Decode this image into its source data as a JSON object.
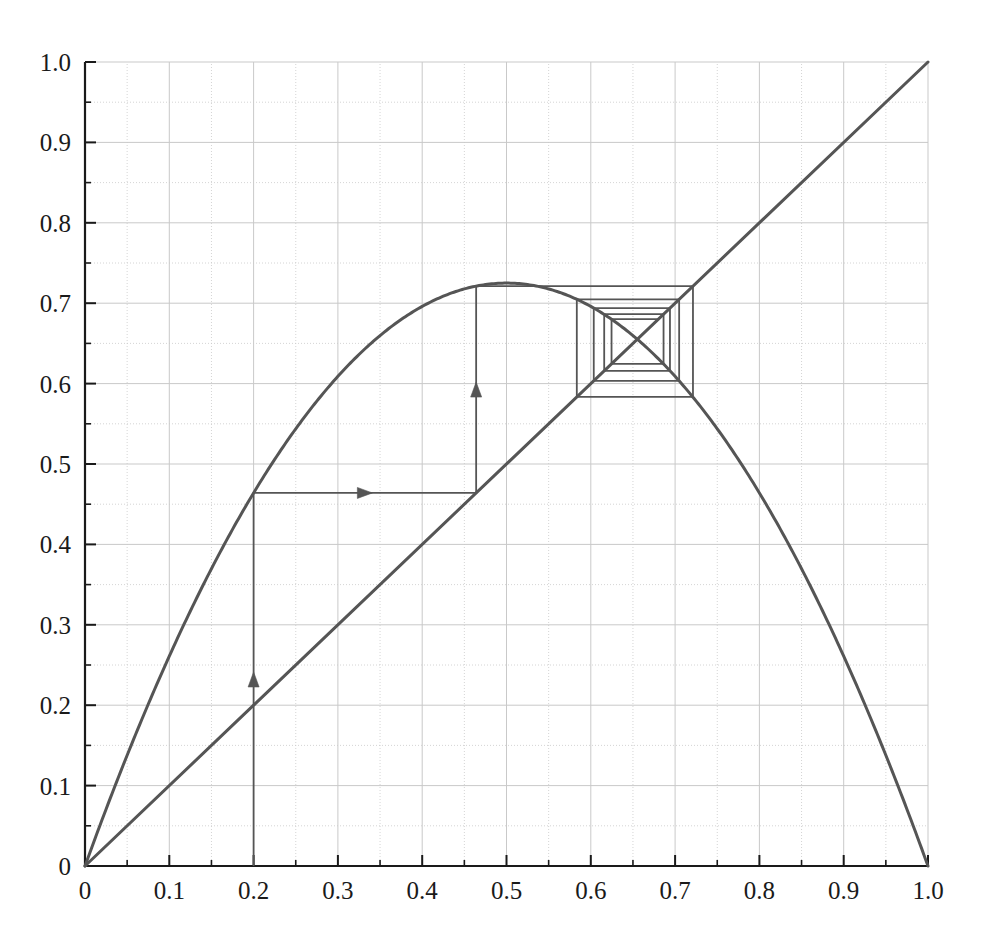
{
  "figure": {
    "background": "#ffffff",
    "width": 981,
    "height": 941
  },
  "chart_data": {
    "type": "line",
    "title": "",
    "subtitle": "",
    "xlabel": "",
    "ylabel": "",
    "xlim": [
      0,
      1
    ],
    "ylim": [
      0,
      1
    ],
    "grid": true,
    "grid_step": 0.05,
    "grid_color": "#c9c9c9",
    "axis_color": "#1a1a1a",
    "curve_color": "#555555",
    "legend": null,
    "legend_position": "none",
    "x_ticks": [
      "0",
      "0.1",
      "0.2",
      "0.3",
      "0.4",
      "0.5",
      "0.6",
      "0.7",
      "0.8",
      "0.9",
      "1.0"
    ],
    "x_tick_values": [
      0,
      0.1,
      0.2,
      0.3,
      0.4,
      0.5,
      0.6,
      0.7,
      0.8,
      0.9,
      1.0
    ],
    "y_ticks": [
      "0",
      "0.1",
      "0.2",
      "0.3",
      "0.4",
      "0.5",
      "0.6",
      "0.7",
      "0.8",
      "0.9",
      "1.0"
    ],
    "y_tick_values": [
      0,
      0.1,
      0.2,
      0.3,
      0.4,
      0.5,
      0.6,
      0.7,
      0.8,
      0.9,
      1.0
    ],
    "minor_tick_values": [
      0.05,
      0.15,
      0.25,
      0.35,
      0.45,
      0.55,
      0.65,
      0.75,
      0.85,
      0.95
    ],
    "series": [
      {
        "name": "logistic-map",
        "kind": "parabola",
        "formula": "f(x) = r x (1 - x)",
        "r": 2.9,
        "peak": [
          0.5,
          0.725
        ],
        "endpoints": [
          [
            0,
            0
          ],
          [
            1,
            0
          ]
        ],
        "color": "#555555"
      },
      {
        "name": "identity-line",
        "kind": "line",
        "formula": "y = x",
        "endpoints": [
          [
            0,
            0
          ],
          [
            1,
            1
          ]
        ],
        "color": "#555555"
      }
    ],
    "cobweb": {
      "name": "cobweb-orbit",
      "x0": 0.2,
      "fixed_point": 0.6552,
      "color": "#555555",
      "arrow_segments": [
        {
          "from": [
            0.2,
            0.0
          ],
          "to": [
            0.2,
            0.464
          ],
          "direction": "up"
        },
        {
          "from": [
            0.2,
            0.464
          ],
          "to": [
            0.464,
            0.464
          ],
          "direction": "right"
        },
        {
          "from": [
            0.464,
            0.464
          ],
          "to": [
            0.464,
            0.7212
          ],
          "direction": "up"
        }
      ],
      "orbit_x": [
        0.2,
        0.464,
        0.7212,
        0.5834,
        0.7048,
        0.6035,
        0.6939,
        0.6159,
        0.6863,
        0.6246,
        0.6803
      ],
      "points": [
        [
          0.2,
          0.0
        ],
        [
          0.2,
          0.464
        ],
        [
          0.464,
          0.464
        ],
        [
          0.464,
          0.7212
        ],
        [
          0.7212,
          0.7212
        ],
        [
          0.7212,
          0.5834
        ],
        [
          0.5834,
          0.5834
        ],
        [
          0.5834,
          0.7048
        ],
        [
          0.7048,
          0.7048
        ],
        [
          0.7048,
          0.6035
        ],
        [
          0.6035,
          0.6035
        ],
        [
          0.6035,
          0.6939
        ],
        [
          0.6939,
          0.6939
        ],
        [
          0.6939,
          0.6159
        ],
        [
          0.6159,
          0.6159
        ],
        [
          0.6159,
          0.6863
        ],
        [
          0.6863,
          0.6863
        ],
        [
          0.6863,
          0.6246
        ],
        [
          0.6246,
          0.6246
        ],
        [
          0.6246,
          0.6803
        ],
        [
          0.6803,
          0.6803
        ]
      ]
    }
  }
}
